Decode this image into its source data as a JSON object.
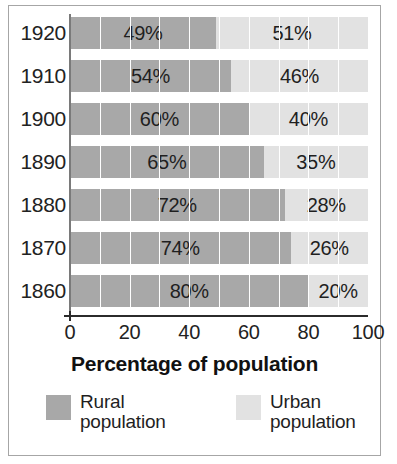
{
  "chart_data": {
    "type": "bar",
    "subtype": "stacked-horizontal-100-percent",
    "title": "",
    "xlabel": "Percentage of population",
    "ylabel": "",
    "xlim": [
      0,
      100
    ],
    "xticks": [
      0,
      20,
      40,
      60,
      80,
      100
    ],
    "xtick_labels": [
      "0",
      "20",
      "40",
      "60",
      "80",
      "100"
    ],
    "gridlines": {
      "orientation": "vertical",
      "interval": 10,
      "values": [
        10,
        20,
        30,
        40,
        50,
        60,
        70,
        80,
        90
      ],
      "visible": true
    },
    "legend_position": "bottom",
    "categories": [
      "1920",
      "1910",
      "1900",
      "1890",
      "1880",
      "1870",
      "1860"
    ],
    "series": [
      {
        "name": "Rural population",
        "color": "#a8a8a8",
        "values": [
          49,
          54,
          60,
          65,
          72,
          74,
          80
        ],
        "labels": [
          "49%",
          "54%",
          "60%",
          "65%",
          "72%",
          "74%",
          "80%"
        ]
      },
      {
        "name": "Urban population",
        "color": "#e2e2e2",
        "values": [
          51,
          46,
          40,
          35,
          28,
          26,
          20
        ],
        "labels": [
          "51%",
          "46%",
          "40%",
          "35%",
          "28%",
          "26%",
          "20%"
        ]
      }
    ],
    "rows": [
      {
        "category": "1920",
        "rural": 49,
        "urban": 51,
        "rural_label": "49%",
        "urban_label": "51%"
      },
      {
        "category": "1910",
        "rural": 54,
        "urban": 46,
        "rural_label": "54%",
        "urban_label": "46%"
      },
      {
        "category": "1900",
        "rural": 60,
        "urban": 40,
        "rural_label": "60%",
        "urban_label": "40%"
      },
      {
        "category": "1890",
        "rural": 65,
        "urban": 35,
        "rural_label": "65%",
        "urban_label": "35%"
      },
      {
        "category": "1880",
        "rural": 72,
        "urban": 28,
        "rural_label": "72%",
        "urban_label": "28%"
      },
      {
        "category": "1870",
        "rural": 74,
        "urban": 26,
        "rural_label": "74%",
        "urban_label": "26%"
      },
      {
        "category": "1860",
        "rural": 80,
        "urban": 20,
        "rural_label": "80%",
        "urban_label": "20%"
      }
    ]
  },
  "axis": {
    "x_title": "Percentage of population",
    "tick_labels": [
      "0",
      "20",
      "40",
      "60",
      "80",
      "100"
    ]
  },
  "legend": {
    "items": [
      {
        "label_line1": "Rural",
        "label_line2": "population",
        "color": "#a8a8a8"
      },
      {
        "label_line1": "Urban",
        "label_line2": "population",
        "color": "#e2e2e2"
      }
    ]
  },
  "colors": {
    "rural": "#a8a8a8",
    "urban": "#e2e2e2",
    "axis": "#2b2b2b",
    "grid": "#ffffff",
    "frame": "#a6a6a6",
    "text": "#1f1f1f"
  }
}
